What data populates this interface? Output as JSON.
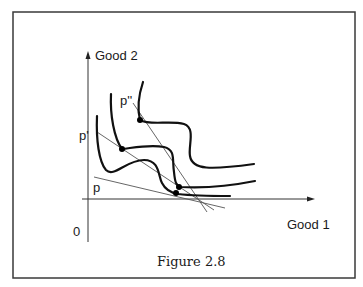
{
  "figure": {
    "caption": "Figure 2.8",
    "frame_color": "#3a3a3a",
    "axes": {
      "x_label": "Good 1",
      "y_label": "Good 2",
      "origin_label": "0"
    },
    "price_lines": [
      {
        "label": "p",
        "x1": 94,
        "y1": 177,
        "x2": 225,
        "y2": 208
      },
      {
        "label": "p'",
        "x1": 97,
        "y1": 132,
        "x2": 214,
        "y2": 210
      },
      {
        "label": "p''",
        "x1": 133,
        "y1": 103,
        "x2": 207,
        "y2": 212
      }
    ],
    "curves": [
      {
        "name": "indifference-curve-low"
      },
      {
        "name": "indifference-curve-mid"
      },
      {
        "name": "indifference-curve-high"
      }
    ],
    "points": [
      {
        "name": "tangency-p",
        "cx": 176,
        "cy": 193
      },
      {
        "name": "tangency-p-prime-mid",
        "cx": 122,
        "cy": 149
      },
      {
        "name": "tangency-p-prime-low",
        "cx": 179,
        "cy": 187
      },
      {
        "name": "tangency-p-double-prime",
        "cx": 140,
        "cy": 120
      }
    ]
  }
}
